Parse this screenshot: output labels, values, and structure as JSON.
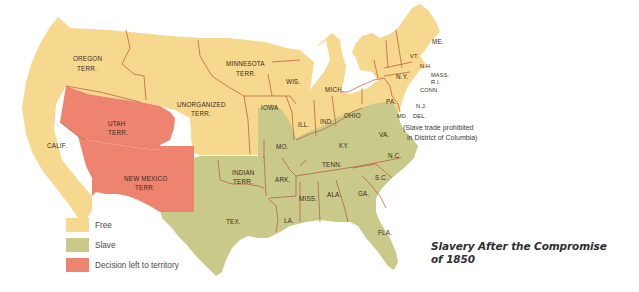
{
  "title": {
    "line1": "Slavery After the Compromise",
    "line2": "of 1850"
  },
  "colors": {
    "free": "#f6d88e",
    "slave": "#c9c98a",
    "territory_decision": "#ee8470",
    "border": "#b8543a",
    "background": "#ffffff"
  },
  "legend": {
    "items": [
      {
        "label": "Free",
        "color": "#f6d88e"
      },
      {
        "label": "Slave",
        "color": "#c9c98a"
      },
      {
        "label": "Decision left to territory",
        "color": "#ee8470"
      }
    ]
  },
  "labels": {
    "oregon": [
      "OREGON",
      "TERR."
    ],
    "minnesota": [
      "MINNESOTA",
      "TERR."
    ],
    "unorganized": [
      "UNORGANIZED",
      "TERR."
    ],
    "utah": [
      "UTAH",
      "TERR."
    ],
    "new_mexico": [
      "NEW MEXICO",
      "TERR."
    ],
    "indian": [
      "INDIAN",
      "TERR."
    ],
    "calif": "CALIF.",
    "wis": "WIS.",
    "iowa": "IOWA",
    "ill": "ILL.",
    "ind": "IND.",
    "mich": "MICH.",
    "ohio": "OHIO",
    "pa": "PA.",
    "ny": "N.Y.",
    "vt": "VT.",
    "nh": "N.H.",
    "me": "ME.",
    "mass": "MASS.",
    "ri": "R.I.",
    "conn": "CONN.",
    "nj": "N.J.",
    "md": "MD.",
    "del": "DEL.",
    "mo": "MO.",
    "ky": "KY.",
    "va": "VA.",
    "nc": "N.C.",
    "tenn": "TENN.",
    "sc": "S.C.",
    "ga": "GA.",
    "ala": "ALA.",
    "miss": "MISS.",
    "ark": "ARK.",
    "la": "LA.",
    "tex": "TEX.",
    "fla": "FLA."
  },
  "annotation": {
    "line1": "(Slave trade prohibited",
    "line2": "in District of Columbia)"
  }
}
